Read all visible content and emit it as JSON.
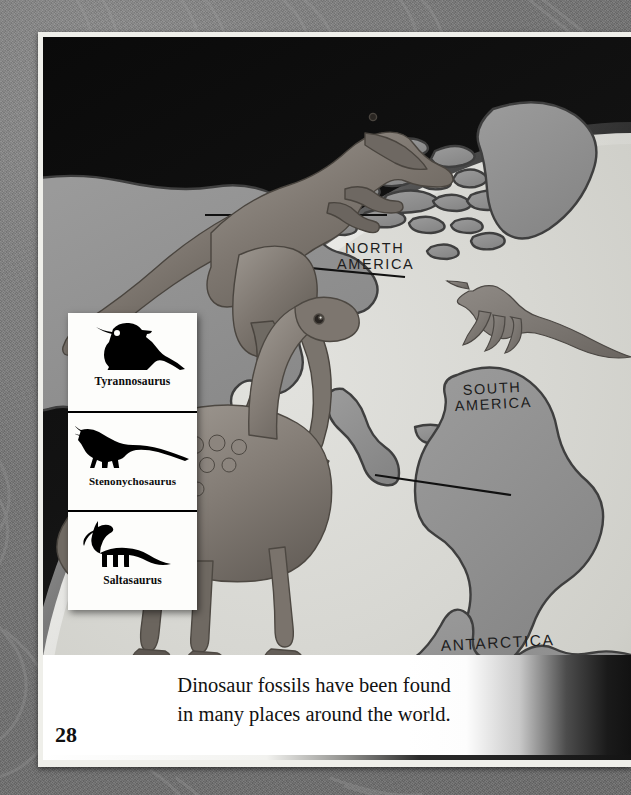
{
  "page": {
    "page_number": "28",
    "background_color": "#767676",
    "frame_color": "#efefea"
  },
  "caption": {
    "line1": "Dinosaur fossils have been found",
    "line2": "in many places around the world."
  },
  "illustration": {
    "title": "dinosaur-world-map-illustration",
    "sky_color": "#111111",
    "ocean_color": "#d6d6d2",
    "land_color": "#8f8f8f",
    "land_outline_color": "#3d3d3d",
    "map_labels": [
      {
        "name": "north-america",
        "text": "NORTH AMERICA",
        "line1": "NORTH",
        "line2": "AMERICA"
      },
      {
        "name": "south-america",
        "text": "SOUTH AMERICA",
        "line1": "SOUTH",
        "line2": "AMERICA"
      },
      {
        "name": "antarctica",
        "text": "ANTARCTICA",
        "line1": "ANTARCTICA",
        "line2": ""
      }
    ],
    "creatures": [
      {
        "name": "tyrannosaurus-illustration",
        "label": "Tyrannosaurus"
      },
      {
        "name": "stenonychosaurus-illustration",
        "label": "Stenonychosaurus"
      },
      {
        "name": "saltasaurus-illustration",
        "label": "Saltasaurus"
      }
    ],
    "pointer_lines": 3
  },
  "legend": {
    "items": [
      {
        "icon": "tyrannosaurus-silhouette-icon",
        "label": "Tyrannosaurus"
      },
      {
        "icon": "stenonychosaurus-silhouette-icon",
        "label": "Stenonychosaurus"
      },
      {
        "icon": "saltasaurus-silhouette-icon",
        "label": "Saltasaurus"
      }
    ]
  }
}
